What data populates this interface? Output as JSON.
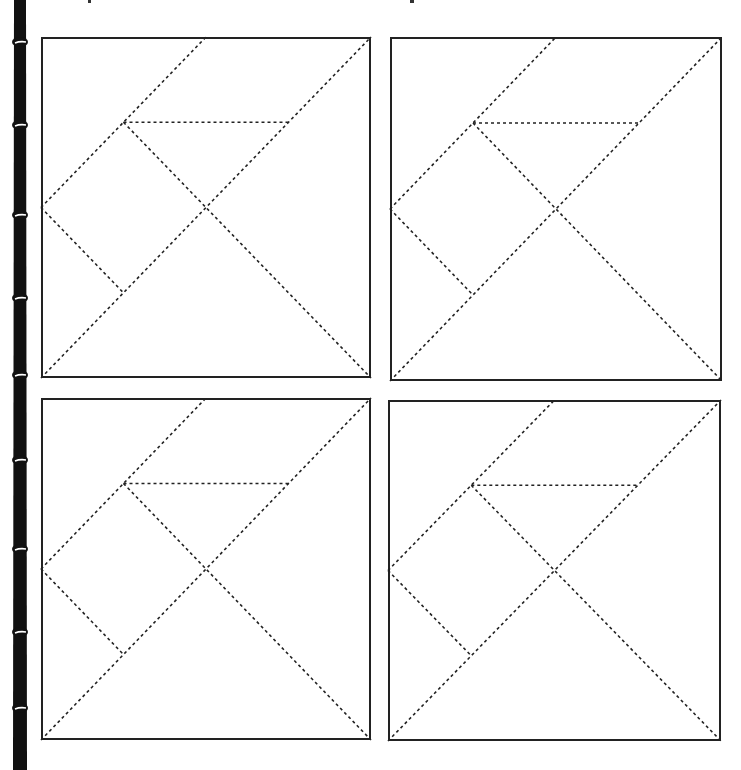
{
  "worksheet": {
    "type": "tangram-outline-sheet",
    "layout": {
      "rows": 2,
      "cols": 2
    },
    "colors": {
      "background": "#ffffff",
      "outline": "#222222",
      "dashed_line": "#222222",
      "bamboo": "#111111",
      "bamboo_node": "#ffffff"
    },
    "decoration": {
      "left_border": "bamboo-stalk",
      "bamboo_nodes_y": [
        42,
        125,
        215,
        298,
        375,
        460,
        549,
        632,
        708
      ]
    },
    "puzzles": [
      {
        "id": 1,
        "label": "Tangram square 1",
        "x": 41,
        "y": 37,
        "w": 330,
        "h": 341
      },
      {
        "id": 2,
        "label": "Tangram square 2",
        "x": 390,
        "y": 37,
        "w": 332,
        "h": 344
      },
      {
        "id": 3,
        "label": "Tangram square 3",
        "x": 41,
        "y": 398,
        "w": 330,
        "h": 342
      },
      {
        "id": 4,
        "label": "Tangram square 4",
        "x": 388,
        "y": 400,
        "w": 333,
        "h": 341
      }
    ],
    "tangram_cut_lines_normalized": [
      {
        "name": "main-diagonal",
        "x1": 0,
        "y1": 1,
        "x2": 1,
        "y2": 0
      },
      {
        "name": "upper-parallel",
        "x1": 0,
        "y1": 0.5,
        "x2": 0.5,
        "y2": 0
      },
      {
        "name": "cross-diagonal",
        "x1": 0.25,
        "y1": 0.25,
        "x2": 1,
        "y2": 1
      },
      {
        "name": "horizontal",
        "x1": 0.25,
        "y1": 0.25,
        "x2": 0.75,
        "y2": 0.25
      },
      {
        "name": "square-edge",
        "x1": 0,
        "y1": 0.5,
        "x2": 0.25,
        "y2": 0.75
      }
    ]
  }
}
